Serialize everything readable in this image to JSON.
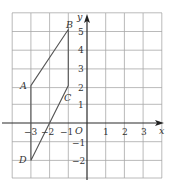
{
  "diagram": {
    "type": "coordinate-grid",
    "x_axis_label": "x",
    "y_axis_label": "y",
    "origin_label": "O",
    "x_range": [
      -4,
      4
    ],
    "y_range": [
      -3,
      6
    ],
    "x_ticks": [
      {
        "value": -3,
        "label": "−3"
      },
      {
        "value": -2,
        "label": "−2"
      },
      {
        "value": -1,
        "label": "−1"
      },
      {
        "value": 1,
        "label": "1"
      },
      {
        "value": 2,
        "label": "2"
      },
      {
        "value": 3,
        "label": "3"
      }
    ],
    "y_ticks": [
      {
        "value": 5,
        "label": "5"
      },
      {
        "value": 4,
        "label": "4"
      },
      {
        "value": 3,
        "label": "3"
      },
      {
        "value": 2,
        "label": "2"
      },
      {
        "value": 1,
        "label": "1"
      },
      {
        "value": -1,
        "label": "−1"
      },
      {
        "value": -2,
        "label": "−2"
      }
    ],
    "points": [
      {
        "name": "A",
        "x": -3,
        "y": 2
      },
      {
        "name": "B",
        "x": -1,
        "y": 5
      },
      {
        "name": "C",
        "x": -1,
        "y": 2
      },
      {
        "name": "D",
        "x": -3,
        "y": -2
      }
    ],
    "shape": "parallelogram ABCD",
    "line_color": "#555555",
    "grid_color": "#a8a8a8"
  }
}
